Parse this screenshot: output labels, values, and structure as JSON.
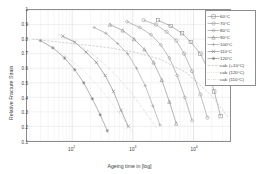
{
  "chart_data": {
    "type": "line",
    "title": "",
    "xlabel": "Ageing time in [log]",
    "ylabel": "Relative Fracture Strain",
    "xscale": "log",
    "yscale": "linear",
    "xlim": [
      18,
      40000
    ],
    "ylim": [
      0.1,
      1.0
    ],
    "grid": true,
    "legend_position": "top-right",
    "xticks": [
      100,
      1000,
      10000
    ],
    "xtick_labels": [
      "10",
      "10",
      "10"
    ],
    "xtick_exponents": [
      "2",
      "3",
      "4"
    ],
    "yticks": [
      0.1,
      0.2,
      0.3,
      0.4,
      0.5,
      0.6,
      0.7,
      0.8,
      0.9,
      1
    ],
    "ytick_labels": [
      "0.1",
      "0.2",
      "0.3",
      "0.4",
      "0.5",
      "0.6",
      "0.7",
      "0.8",
      "0.9",
      "1"
    ],
    "series": [
      {
        "name": "60°C",
        "label": "60°C",
        "color": "#7d7d7d",
        "marker": "square",
        "style": "solid",
        "x": [
          2600,
          4200,
          6500,
          9000,
          13000,
          17000,
          22000,
          28000
        ],
        "y": [
          0.93,
          0.89,
          0.84,
          0.78,
          0.7,
          0.6,
          0.44,
          0.27
        ]
      },
      {
        "name": "70°C",
        "label": "70°C",
        "color": "#8a8a8a",
        "marker": "circle",
        "style": "solid",
        "x": [
          1500,
          2400,
          3600,
          5200,
          7000,
          9500,
          13000,
          17000
        ],
        "y": [
          0.93,
          0.9,
          0.85,
          0.79,
          0.7,
          0.58,
          0.42,
          0.26
        ]
      },
      {
        "name": "80°C",
        "label": "80°C",
        "color": "#858585",
        "marker": "diamond",
        "style": "solid",
        "x": [
          800,
          1300,
          2000,
          2900,
          4000,
          5400,
          7200,
          9500
        ],
        "y": [
          0.92,
          0.88,
          0.83,
          0.76,
          0.67,
          0.55,
          0.4,
          0.24
        ]
      },
      {
        "name": "90°C",
        "label": "90°C",
        "color": "#7a7a7a",
        "marker": "triangle",
        "style": "solid",
        "x": [
          420,
          680,
          1050,
          1550,
          2200,
          3000,
          4000,
          5200
        ],
        "y": [
          0.9,
          0.86,
          0.8,
          0.73,
          0.64,
          0.52,
          0.37,
          0.22
        ]
      },
      {
        "name": "100°C",
        "label": "100°C",
        "color": "#8f8f8f",
        "marker": "plus",
        "style": "solid",
        "x": [
          230,
          360,
          560,
          820,
          1150,
          1600,
          2150,
          2800
        ],
        "y": [
          0.88,
          0.84,
          0.77,
          0.7,
          0.6,
          0.48,
          0.34,
          0.21
        ]
      },
      {
        "name": "110°C",
        "label": "110°C",
        "color": "#6f6f6f",
        "marker": "cross",
        "style": "solid",
        "x": [
          70,
          110,
          170,
          250,
          350,
          480,
          640,
          840
        ],
        "y": [
          0.82,
          0.78,
          0.71,
          0.64,
          0.55,
          0.44,
          0.31,
          0.2
        ]
      },
      {
        "name": "120°C",
        "label": "120°C",
        "color": "#747474",
        "marker": "star",
        "style": "solid",
        "x": [
          30,
          48,
          75,
          110,
          155,
          215,
          290,
          380
        ],
        "y": [
          0.79,
          0.74,
          0.67,
          0.59,
          0.5,
          0.39,
          0.28,
          0.17
        ]
      },
      {
        "name": "calc (+10°C)",
        "label": "calc (+10°C)",
        "color": "#b0b0b0",
        "marker": "none",
        "style": "dashed",
        "x": [
          22,
          60,
          160,
          420,
          1100,
          2900,
          7600,
          20000,
          38000
        ],
        "y": [
          0.8,
          0.78,
          0.76,
          0.74,
          0.71,
          0.66,
          0.57,
          0.41,
          0.26
        ]
      },
      {
        "name": "calc (120°C)",
        "label": "calc (120°C)",
        "color": "#bdbdbd",
        "marker": "none",
        "style": "dotted",
        "x": [
          26,
          45,
          80,
          140,
          240,
          400,
          650,
          1000
        ],
        "y": [
          0.8,
          0.75,
          0.68,
          0.6,
          0.5,
          0.39,
          0.27,
          0.16
        ]
      },
      {
        "name": "calc (110°C)",
        "label": "calc (110°C)",
        "color": "#c4c4c4",
        "marker": "none",
        "style": "dashdot",
        "x": [
          60,
          105,
          185,
          320,
          560,
          950,
          1600,
          2500
        ],
        "y": [
          0.83,
          0.78,
          0.72,
          0.64,
          0.54,
          0.43,
          0.3,
          0.19
        ]
      }
    ]
  },
  "legend": {
    "items": [
      {
        "label": "60°C"
      },
      {
        "label": "70°C"
      },
      {
        "label": "80°C"
      },
      {
        "label": "90°C"
      },
      {
        "label": "100°C"
      },
      {
        "label": "110°C"
      },
      {
        "label": "120°C"
      },
      {
        "label": "calc (+10°C)"
      },
      {
        "label": "calc (120°C)"
      },
      {
        "label": "calc (110°C)"
      }
    ]
  }
}
